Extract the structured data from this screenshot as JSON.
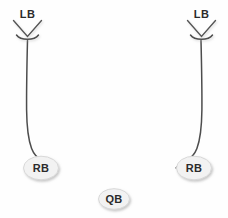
{
  "diagram": {
    "background_color": "#fefefe",
    "width": 228,
    "height": 218,
    "line_color": "#4d4d4d",
    "oval_fill_color": "#f2f2f2",
    "oval_stroke_color": "#d8d8d8",
    "label_color": "#2b2b2b"
  },
  "players": [
    {
      "id": "lb-left",
      "label": "LB",
      "role": "linebacker",
      "marker": "chevron-down",
      "x": 27,
      "y": 15
    },
    {
      "id": "lb-right",
      "label": "LB",
      "role": "linebacker",
      "marker": "chevron-down",
      "x": 202,
      "y": 15
    },
    {
      "id": "rb-left",
      "label": "RB",
      "role": "running-back",
      "marker": "oval",
      "x": 41,
      "y": 168
    },
    {
      "id": "rb-right",
      "label": "RB",
      "role": "running-back",
      "marker": "oval",
      "x": 194,
      "y": 168
    },
    {
      "id": "qb",
      "label": "QB",
      "role": "quarterback",
      "marker": "oval",
      "x": 114,
      "y": 199
    }
  ],
  "routes": [
    {
      "id": "route-left",
      "from": "rb-left",
      "to": "lb-left",
      "description": "Left running back blitz pickup path"
    },
    {
      "id": "route-right",
      "from": "rb-right",
      "to": "lb-right",
      "description": "Right running back blitz pickup path"
    }
  ]
}
